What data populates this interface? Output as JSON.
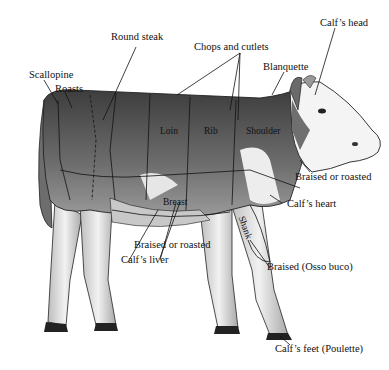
{
  "diagram": {
    "subject": "calf",
    "labels": {
      "calfs_head": "Calf’s head",
      "round_steak": "Round steak",
      "chops_and_cutlets": "Chops and cutlets",
      "blanquette": "Blanquette",
      "scallopine": "Scallopine",
      "roasts": "Roasts",
      "loin": "Loin",
      "rib": "Rib",
      "shoulder": "Shoulder",
      "braised_or_roasted_right": "Braised or roasted",
      "calfs_heart": "Calf’s heart",
      "breast": "Breast",
      "shank": "Shank",
      "braised_or_roasted_left": "Braised or roasted",
      "calfs_liver": "Calf’s liver",
      "braised_osso_buco": "Braised (Osso buco)",
      "calfs_feet": "Calf’s feet (Poulette)"
    },
    "colors": {
      "background": "#ffffff",
      "body_dark": "#5a5a5a",
      "body_mid": "#8a8a8a",
      "white_patch": "#f0f0f0",
      "line": "#111111"
    }
  }
}
